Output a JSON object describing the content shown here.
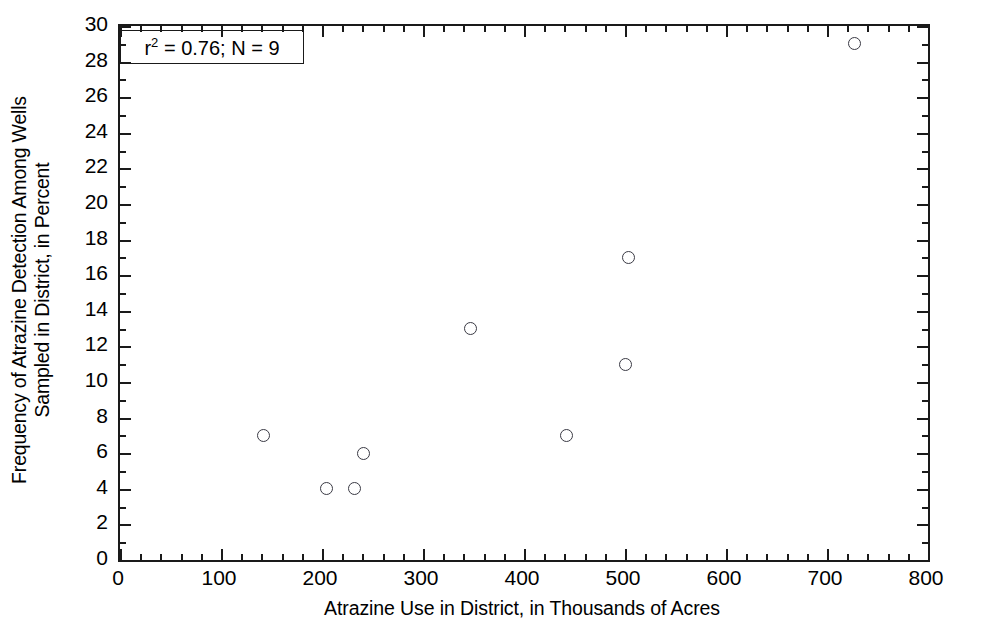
{
  "chart_data": {
    "type": "scatter",
    "title": "",
    "xlabel": "Atrazine Use in District, in Thousands of Acres",
    "ylabel_line1": "Frequency of Atrazine Detection Among Wells",
    "ylabel_line2": "Sampled in District, in Percent",
    "xlim": [
      0,
      800
    ],
    "ylim": [
      0,
      30
    ],
    "x_major_step": 100,
    "x_minor_step": 20,
    "y_major_step": 2,
    "y_minor_step": 1,
    "grid": false,
    "legend": "none",
    "marker": "open-circle",
    "x_tick_labels": [
      "0",
      "100",
      "200",
      "300",
      "400",
      "500",
      "600",
      "700",
      "800"
    ],
    "y_tick_labels": [
      "0",
      "2",
      "4",
      "6",
      "8",
      "10",
      "12",
      "14",
      "16",
      "18",
      "20",
      "22",
      "24",
      "26",
      "28",
      "30"
    ],
    "x_tick_values": [
      0,
      100,
      200,
      300,
      400,
      500,
      600,
      700,
      800
    ],
    "y_tick_values": [
      0,
      2,
      4,
      6,
      8,
      10,
      12,
      14,
      16,
      18,
      20,
      22,
      24,
      26,
      28,
      30
    ],
    "points": [
      {
        "x": 142,
        "y": 7
      },
      {
        "x": 204,
        "y": 4
      },
      {
        "x": 232,
        "y": 4
      },
      {
        "x": 241,
        "y": 6
      },
      {
        "x": 347,
        "y": 13
      },
      {
        "x": 442,
        "y": 7
      },
      {
        "x": 500,
        "y": 11
      },
      {
        "x": 503,
        "y": 17
      },
      {
        "x": 727,
        "y": 29
      }
    ],
    "annotation": {
      "r_squared": "0.76",
      "n": "9",
      "prefix": "r",
      "superscript": "2",
      "text": "r2 = 0.76; N = 9",
      "middle": " = 0.76; N = 9"
    },
    "colors": {
      "axis": "#1a1a1a",
      "marker": "#3a3a44",
      "background": "#ffffff"
    }
  }
}
